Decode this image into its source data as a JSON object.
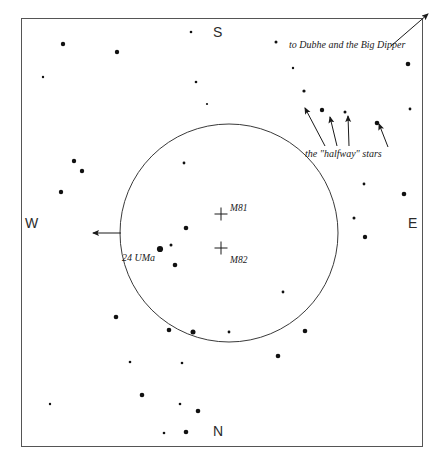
{
  "chart_data": {
    "type": "scatter",
    "title": "",
    "xlabel": "",
    "ylabel": "",
    "xlim": [
      0,
      444
    ],
    "ylim": [
      0,
      463
    ],
    "grid": false,
    "legend": "none",
    "frame": {
      "x": 21,
      "y": 18,
      "width": 402,
      "height": 429,
      "stroke": "#555555",
      "fill": "#ffffff"
    },
    "field_circle": {
      "cx": 229,
      "cy": 233,
      "r": 109,
      "stroke": "#3a3a3a",
      "fill": "none"
    },
    "cardinals": [
      {
        "name": "south",
        "label": "S",
        "x": 213,
        "y": 24
      },
      {
        "name": "north",
        "label": "N",
        "x": 213,
        "y": 423
      },
      {
        "name": "west",
        "label": "W",
        "x": 25,
        "y": 215
      },
      {
        "name": "east",
        "label": "E",
        "x": 408,
        "y": 215
      }
    ],
    "objects": [
      {
        "name": "M81",
        "marker": "cross",
        "x": 221,
        "y": 214,
        "size": 13,
        "label": "M81",
        "label_x": 230,
        "label_y": 203
      },
      {
        "name": "M82",
        "marker": "cross",
        "x": 221,
        "y": 248,
        "size": 13,
        "label": "M82",
        "label_x": 230,
        "label_y": 255
      }
    ],
    "annotations": [
      {
        "name": "dipper",
        "text": "to Dubhe and the Big Dipper",
        "x": 289,
        "y": 39
      },
      {
        "name": "halfway",
        "text": "the \"halfway\" stars",
        "x": 305,
        "y": 148
      },
      {
        "name": "uma",
        "text": "24 UMa",
        "x": 122,
        "y": 252
      }
    ],
    "arrows": [
      {
        "name": "dipper-arrow",
        "x1": 391,
        "y1": 46,
        "x2": 428,
        "y2": 14
      },
      {
        "name": "halfway-arrow-1",
        "x1": 325,
        "y1": 146,
        "x2": 305,
        "y2": 108
      },
      {
        "name": "halfway-arrow-2",
        "x1": 337,
        "y1": 146,
        "x2": 330,
        "y2": 117
      },
      {
        "name": "halfway-arrow-3",
        "x1": 349,
        "y1": 146,
        "x2": 348,
        "y2": 116
      },
      {
        "name": "halfway-arrow-4",
        "x1": 388,
        "y1": 147,
        "x2": 379,
        "y2": 124
      },
      {
        "name": "west-arrow",
        "x1": 121,
        "y1": 233,
        "x2": 93,
        "y2": 233
      }
    ],
    "stars": [
      {
        "x": 63,
        "y": 44,
        "r": 2.2
      },
      {
        "x": 117,
        "y": 52,
        "r": 2.2
      },
      {
        "x": 191,
        "y": 32,
        "r": 1.3
      },
      {
        "x": 196,
        "y": 82,
        "r": 1.3
      },
      {
        "x": 207,
        "y": 104,
        "r": 1.1
      },
      {
        "x": 276,
        "y": 42,
        "r": 1.5
      },
      {
        "x": 293,
        "y": 68,
        "r": 1.2
      },
      {
        "x": 304,
        "y": 91,
        "r": 1.6
      },
      {
        "x": 322,
        "y": 110,
        "r": 2.2
      },
      {
        "x": 345,
        "y": 112,
        "r": 1.5
      },
      {
        "x": 377,
        "y": 123,
        "r": 2.3
      },
      {
        "x": 408,
        "y": 64,
        "r": 2.3
      },
      {
        "x": 410,
        "y": 109,
        "r": 1.4
      },
      {
        "x": 364,
        "y": 184,
        "r": 1.4
      },
      {
        "x": 354,
        "y": 218,
        "r": 1.5
      },
      {
        "x": 365,
        "y": 237,
        "r": 2.2
      },
      {
        "x": 404,
        "y": 194,
        "r": 2.3
      },
      {
        "x": 74,
        "y": 161,
        "r": 2.2
      },
      {
        "x": 82,
        "y": 171,
        "r": 2.2
      },
      {
        "x": 61,
        "y": 192,
        "r": 2.2
      },
      {
        "x": 184,
        "y": 163,
        "r": 1.4
      },
      {
        "x": 186,
        "y": 228,
        "r": 2.3
      },
      {
        "x": 171,
        "y": 245,
        "r": 1.5
      },
      {
        "x": 160,
        "y": 249,
        "r": 3.1
      },
      {
        "x": 175,
        "y": 265,
        "r": 2.3
      },
      {
        "x": 283,
        "y": 292,
        "r": 1.4
      },
      {
        "x": 305,
        "y": 331,
        "r": 2.3
      },
      {
        "x": 116,
        "y": 317,
        "r": 2.3
      },
      {
        "x": 169,
        "y": 330,
        "r": 2.3
      },
      {
        "x": 193,
        "y": 332,
        "r": 2.5
      },
      {
        "x": 229,
        "y": 332,
        "r": 1.4
      },
      {
        "x": 130,
        "y": 362,
        "r": 1.3
      },
      {
        "x": 182,
        "y": 363,
        "r": 1.3
      },
      {
        "x": 142,
        "y": 395,
        "r": 2.3
      },
      {
        "x": 50,
        "y": 404,
        "r": 1.2
      },
      {
        "x": 180,
        "y": 404,
        "r": 1.3
      },
      {
        "x": 198,
        "y": 411,
        "r": 2.3
      },
      {
        "x": 164,
        "y": 433,
        "r": 1.3
      },
      {
        "x": 186,
        "y": 432,
        "r": 2.3
      },
      {
        "x": 43,
        "y": 77,
        "r": 1.2
      },
      {
        "x": 278,
        "y": 356,
        "r": 2.3
      }
    ]
  }
}
